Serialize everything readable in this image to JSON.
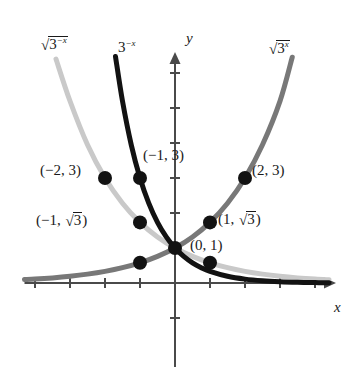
{
  "figure": {
    "background_color": "#ffffff"
  },
  "axes": {
    "x_axis_label": "x",
    "y_axis_label": "y",
    "origin_px": [
      175,
      283
    ],
    "pixels_per_unit": 35,
    "x_ticks": [
      -4,
      -3,
      -2,
      -1,
      1,
      2,
      3,
      4
    ],
    "y_ticks": [
      -1,
      1,
      2,
      3,
      4,
      5,
      6
    ],
    "x_range": [
      -4.3,
      4.6
    ],
    "y_range": [
      -2.4,
      6.6
    ],
    "arrow_on_x_positive": true,
    "arrow_on_y_positive": true,
    "tick_half_length_px": 5,
    "axis_color": "#4a4a4a"
  },
  "curve_labels": [
    {
      "name": "sqrt-3-neg-x",
      "text": "√3⁻ˣ",
      "radical": true,
      "base": "3",
      "exponent": "−x",
      "x_px": 40,
      "y_px": 36
    },
    {
      "name": "3-neg-x",
      "text": "3⁻ˣ",
      "radical": false,
      "base": "3",
      "exponent": "−x",
      "x_px": 118,
      "y_px": 40
    },
    {
      "name": "sqrt-3-x",
      "text": "√3ˣ",
      "radical": true,
      "base": "3",
      "exponent": "x",
      "x_px": 268,
      "y_px": 40
    }
  ],
  "point_labels": [
    {
      "name": "label-neg2-3",
      "text": "(−2, 3)",
      "x_px": 40,
      "y_px": 163
    },
    {
      "name": "label-neg1-3",
      "text": "(−1, 3)",
      "x_px": 143,
      "y_px": 148
    },
    {
      "name": "label-2-3",
      "text": "(2, 3)",
      "x_px": 252,
      "y_px": 163
    },
    {
      "name": "label-neg1-sqrt3",
      "text": "(−1, √3)",
      "x_px": 36,
      "y_px": 212,
      "has_radical": true,
      "prefix": "(−1, ",
      "radicand": "3",
      "suffix": ")"
    },
    {
      "name": "label-1-sqrt3",
      "text": "(1, √3)",
      "x_px": 218,
      "y_px": 211,
      "has_radical": true,
      "prefix": "(1, ",
      "radicand": "3",
      "suffix": ")"
    },
    {
      "name": "label-0-1",
      "text": "(0, 1)",
      "x_px": 190,
      "y_px": 238
    }
  ],
  "chart_data": {
    "type": "line",
    "title": "",
    "xlabel": "x",
    "ylabel": "y",
    "xlim": [
      -4.3,
      4.6
    ],
    "ylim": [
      -2.4,
      6.6
    ],
    "grid": false,
    "legend": "inline curve labels",
    "x_ticks": [
      -4,
      -3,
      -2,
      -1,
      0,
      1,
      2,
      3,
      4
    ],
    "y_ticks": [
      -1,
      0,
      1,
      2,
      3,
      4,
      5,
      6
    ],
    "series": [
      {
        "name": "sqrt(3^-x)",
        "expression": "y = √(3^−x) = 3^(−x/2)",
        "color": "#c9c9c9",
        "stroke_width": 5,
        "x": [
          -3.4,
          -3.0,
          -2.5,
          -2.0,
          -1.5,
          -1.0,
          -0.5,
          0.0,
          0.5,
          1.0,
          1.5,
          2.0,
          2.5,
          3.0,
          3.5,
          4.0,
          4.4
        ],
        "y": [
          6.4,
          5.2,
          3.95,
          3.0,
          2.28,
          1.732,
          1.316,
          1.0,
          0.76,
          0.577,
          0.439,
          0.333,
          0.253,
          0.192,
          0.146,
          0.111,
          0.09
        ]
      },
      {
        "name": "3^-x",
        "expression": "y = 3^−x",
        "color": "#121212",
        "stroke_width": 5,
        "x": [
          -1.7,
          -1.5,
          -1.25,
          -1.0,
          -0.75,
          -0.5,
          -0.25,
          0.0,
          0.25,
          0.5,
          0.75,
          1.0,
          1.5,
          2.0,
          2.5,
          3.0,
          3.5,
          4.0,
          4.4
        ],
        "y": [
          6.47,
          5.196,
          3.948,
          3.0,
          2.28,
          1.732,
          1.316,
          1.0,
          0.76,
          0.577,
          0.439,
          0.333,
          0.192,
          0.111,
          0.064,
          0.037,
          0.021,
          0.012,
          0.008
        ]
      },
      {
        "name": "sqrt(3^x)",
        "expression": "y = √(3^x) = 3^(x/2)",
        "color": "#787878",
        "stroke_width": 5,
        "x": [
          -4.3,
          -4.0,
          -3.5,
          -3.0,
          -2.5,
          -2.0,
          -1.5,
          -1.0,
          -0.5,
          0.0,
          0.5,
          1.0,
          1.5,
          2.0,
          2.5,
          3.0,
          3.35
        ],
        "y": [
          0.097,
          0.111,
          0.146,
          0.192,
          0.253,
          0.333,
          0.439,
          0.577,
          0.76,
          1.0,
          1.316,
          1.732,
          2.28,
          3.0,
          3.948,
          5.196,
          6.45
        ]
      }
    ],
    "points": [
      {
        "label": "(−2, 3)",
        "x": -2,
        "y": 3,
        "on_series": "sqrt(3^-x)"
      },
      {
        "label": "(−1, 3)",
        "x": -1,
        "y": 3,
        "on_series": "3^-x"
      },
      {
        "label": "(2, 3)",
        "x": 2,
        "y": 3,
        "on_series": "sqrt(3^x)"
      },
      {
        "label": "(−1, √3)",
        "x": -1,
        "y": 1.732,
        "on_series": "sqrt(3^-x)"
      },
      {
        "label": "(1, √3)",
        "x": 1,
        "y": 1.732,
        "on_series": "sqrt(3^x)"
      },
      {
        "label": "(0, 1)",
        "x": 0,
        "y": 1,
        "on_series": "all three"
      },
      {
        "label": "",
        "x": -1,
        "y": 0.577,
        "on_series": "sqrt(3^x)"
      },
      {
        "label": "",
        "x": 1,
        "y": 0.577,
        "on_series": "sqrt(3^-x)"
      }
    ],
    "point_marker": {
      "shape": "circle",
      "radius_px": 7,
      "color": "#121212"
    }
  }
}
